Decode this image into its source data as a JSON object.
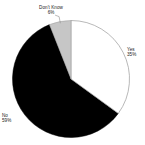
{
  "chart_data": {
    "type": "pie",
    "title": "",
    "categories": [
      "Yes",
      "No",
      "Don't Know"
    ],
    "values": [
      35,
      59,
      6
    ],
    "value_suffix": "%",
    "legend": "none",
    "labels_position": "outside-with-leader",
    "start_angle_deg": 0,
    "direction": "clockwise",
    "slices": [
      {
        "label": "Yes",
        "value": 35,
        "value_text": "35%",
        "color": "#ffffff",
        "stroke": "#9a9a9a"
      },
      {
        "label": "No",
        "value": 59,
        "value_text": "59%",
        "color": "#000000",
        "stroke": "#000000"
      },
      {
        "label": "Don't Know",
        "value": 6,
        "value_text": "6%",
        "color": "#c6c6c6",
        "stroke": "#9a9a9a"
      }
    ]
  },
  "labels": {
    "yes": {
      "name": "Yes",
      "value": "35%"
    },
    "no": {
      "name": "No",
      "value": "59%"
    },
    "dont_know": {
      "name": "Don't Know",
      "value": "6%"
    }
  },
  "colors": {
    "background": "#ffffff",
    "yes_fill": "#ffffff",
    "no_fill": "#000000",
    "dont_know_fill": "#c6c6c6",
    "outline": "#9a9a9a",
    "text": "#1a1a1a",
    "leader_line": "#8c8c8c"
  }
}
